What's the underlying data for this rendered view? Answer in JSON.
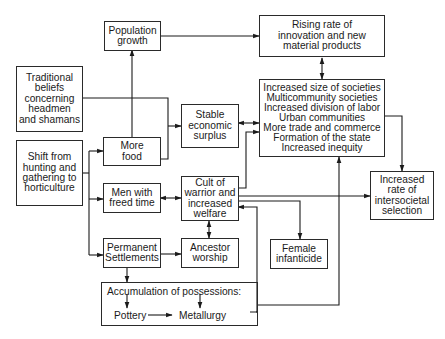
{
  "diagram": {
    "nodes": {
      "population_growth": {
        "lines": [
          "Population",
          "growth"
        ]
      },
      "rising_rate": {
        "lines": [
          "Rising rate of",
          "innovation and new",
          "material products"
        ]
      },
      "traditional_beliefs": {
        "lines": [
          "Traditional",
          "beliefs",
          "concerning",
          "headmen",
          "and shamans"
        ]
      },
      "stable_surplus": {
        "lines": [
          "Stable",
          "economic",
          "surplus"
        ]
      },
      "societal_changes": {
        "lines": [
          "Increased size of societies",
          "Multicommunity societies",
          "Increased division of labor",
          "Urban communities",
          "More trade and commerce",
          "Formation of the state",
          "Increased inequity"
        ]
      },
      "more_food": {
        "lines": [
          "More",
          "food"
        ]
      },
      "shift_horticulture": {
        "lines": [
          "Shift from",
          "hunting and",
          "gathering to",
          "horticulture"
        ]
      },
      "men_freed_time": {
        "lines": [
          "Men with",
          "freed time"
        ]
      },
      "cult_warrior": {
        "lines": [
          "Cult of",
          "warrior and",
          "increased",
          "welfare"
        ]
      },
      "intersocietal_selection": {
        "lines": [
          "Increased",
          "rate of",
          "intersocietal",
          "selection"
        ]
      },
      "permanent_settlements": {
        "lines": [
          "Permanent",
          "Settlements"
        ]
      },
      "ancestor_worship": {
        "lines": [
          "Ancestor",
          "worship"
        ]
      },
      "female_infanticide": {
        "lines": [
          "Female",
          "infanticide"
        ]
      },
      "accumulation": {
        "title": "Accumulation of possessions:",
        "pottery": "Pottery",
        "metallurgy": "Metallurgy"
      }
    },
    "edges": [
      {
        "from": "shift_horticulture",
        "to": "more_food"
      },
      {
        "from": "shift_horticulture",
        "to": "men_freed_time"
      },
      {
        "from": "shift_horticulture",
        "to": "permanent_settlements"
      },
      {
        "from": "more_food",
        "to": "population_growth"
      },
      {
        "from": "population_growth",
        "to": "rising_rate"
      },
      {
        "from": "traditional_beliefs",
        "to": "stable_surplus"
      },
      {
        "from": "more_food",
        "to": "stable_surplus"
      },
      {
        "from": "stable_surplus",
        "to": "societal_changes",
        "bidirectional": true
      },
      {
        "from": "rising_rate",
        "to": "societal_changes",
        "bidirectional": true
      },
      {
        "from": "societal_changes",
        "to": "intersocietal_selection"
      },
      {
        "from": "men_freed_time",
        "to": "cult_warrior",
        "bidirectional": true
      },
      {
        "from": "cult_warrior",
        "to": "societal_changes"
      },
      {
        "from": "cult_warrior",
        "to": "intersocietal_selection"
      },
      {
        "from": "cult_warrior",
        "to": "female_infanticide"
      },
      {
        "from": "cult_warrior",
        "to": "ancestor_worship",
        "bidirectional": true
      },
      {
        "from": "permanent_settlements",
        "to": "ancestor_worship"
      },
      {
        "from": "permanent_settlements",
        "to": "accumulation"
      },
      {
        "from": "pottery",
        "to": "metallurgy"
      },
      {
        "from": "accumulation",
        "to": "societal_changes"
      },
      {
        "from": "accumulation",
        "to": "cult_warrior"
      }
    ]
  }
}
